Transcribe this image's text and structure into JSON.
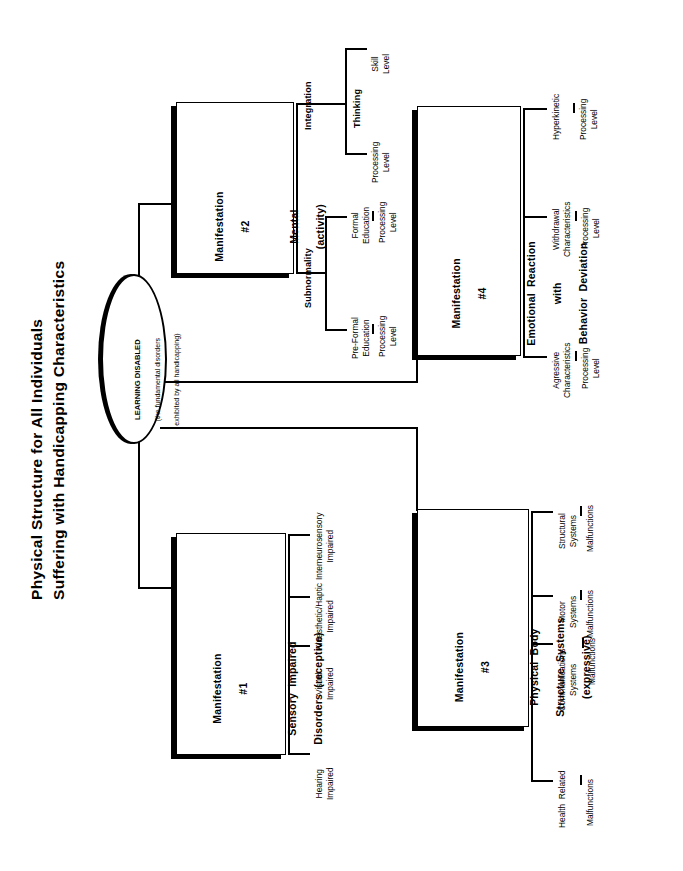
{
  "title": {
    "line1": "Physical Structure for All Individuals",
    "line2": "Suffering with Handicapping Characteristics"
  },
  "root": {
    "label": "LEARNING DISABLED",
    "sub1": "(the fundamental disorders",
    "sub2": "exhibited by all handicapping)"
  },
  "manifestations": [
    {
      "id": "m1",
      "number": "Manifestation",
      "hash": "#1",
      "name_line1": "Sensory  Impaired",
      "name_line2": "Disorders  (receptive)",
      "branches": [
        {
          "label": "Hearing\nImpaired",
          "child": ""
        },
        {
          "label": "Visual\nImpaired",
          "child": ""
        },
        {
          "label": "Kinesthetic/Haptic\nImpaired",
          "child": ""
        },
        {
          "label": "Interneurosensory\nImpaired",
          "child": ""
        }
      ]
    },
    {
      "id": "m2",
      "number": "Manifestation",
      "hash": "#2",
      "name_line1": "Mental",
      "name_line2": "(activity)",
      "branches": [
        {
          "label": "Subnormality",
          "children": [
            {
              "label": "Pre-Formal\nEducation",
              "child": "Processing\nLevel"
            },
            {
              "label": "Formal\nEducation",
              "child": "Processing\nLevel"
            }
          ]
        },
        {
          "label": "Integration",
          "children": [
            {
              "label": "Thinking",
              "subs": [
                {
                  "label": "Processing\nLevel"
                },
                {
                  "label": "Skill\nLevel"
                }
              ]
            }
          ]
        }
      ]
    },
    {
      "id": "m3",
      "number": "Manifestation",
      "hash": "#3",
      "name_line1": "Physical  Body",
      "name_line2": "Structure  Systems",
      "name_line3": "(expressive)",
      "branches": [
        {
          "label": "Health  Related",
          "child": "Malfunctions"
        },
        {
          "label": "Communications\nSystems",
          "child": "Malfunctions"
        },
        {
          "label": "Motor\nSystems",
          "child": "Malfunctions"
        },
        {
          "label": "Structural\nSystems",
          "child": "Malfunctions"
        }
      ]
    },
    {
      "id": "m4",
      "number": "Manifestation",
      "hash": "#4",
      "name_line1": "Emotional  Reaction",
      "name_line2": "with",
      "name_line3": "Behavior  Deviation",
      "branches": [
        {
          "label": "Agressive\nCharacteristics",
          "child": "Processing\nLevel"
        },
        {
          "label": "Withdrawal\nCharacteristics",
          "child": "Processing\nLevel"
        },
        {
          "label": "Hyperkinetic",
          "child": "Processing\nLevel"
        }
      ]
    }
  ],
  "leaves": {
    "m1_b1": "Hearing\nImpaired",
    "m1_b2": "Visual\nImpaired",
    "m1_b3": "Kinesthetic/Haptic\nImpaired",
    "m1_b4": "Interneurosensory\nImpaired",
    "m2_sub": "Subnormality",
    "m2_int": "Integration",
    "m2_preformal": "Pre-Formal\nEducation",
    "m2_preformal_child": "Processing\nLevel",
    "m2_formal": "Formal\nEducation",
    "m2_formal_child": "Processing\nLevel",
    "m2_thinking": "Thinking",
    "m2_thinking_proc": "Processing\nLevel",
    "m2_thinking_skill": "Skill\nLevel",
    "m3_b1": "Health  Related",
    "m3_b1_child": "Malfunctions",
    "m3_b2": "Communications\nSystems",
    "m3_b2_child": "Malfunctions",
    "m3_b3": "Motor\nSystems",
    "m3_b3_child": "Malfunctions",
    "m3_b4": "Structural\nSystems",
    "m3_b4_child": "Malfunctions",
    "m4_b1": "Agressive\nCharacteristics",
    "m4_b1_child": "Processing\nLevel",
    "m4_b2": "Withdrawal\nCharacteristics",
    "m4_b2_child": "Processing\nLevel",
    "m4_b3": "Hyperkinetic",
    "m4_b3_child": "Processing\nLevel"
  },
  "colors": {
    "ink": "#000000",
    "paper": "#ffffff"
  }
}
